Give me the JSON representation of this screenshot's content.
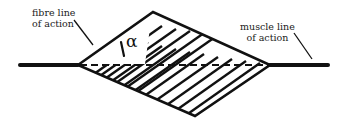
{
  "diagram": {
    "type": "pennate-muscle-schematic",
    "labels": {
      "fibre": [
        "fibre line",
        "of action"
      ],
      "muscle": [
        "muscle line",
        "of action"
      ],
      "angle": "α"
    },
    "colors": {
      "stroke": "#111111",
      "background": "#ffffff",
      "text": "#222222"
    },
    "geometry": {
      "left_vertex": [
        78,
        65
      ],
      "top_vertex": [
        153,
        12
      ],
      "right_vertex": [
        270,
        65
      ],
      "bottom_vertex": [
        195,
        116
      ],
      "tendon_left": [
        19,
        78
      ],
      "tendon_right": [
        270,
        329
      ]
    }
  }
}
